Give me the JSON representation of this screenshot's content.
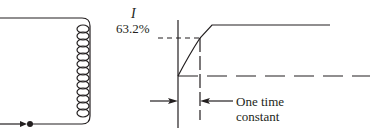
{
  "figure": {
    "circuit": {
      "components": [
        "wire",
        "inductor-coil",
        "junction-dot",
        "current-arrow"
      ]
    },
    "graph": {
      "y_label": "I",
      "level_label": "63.2%",
      "annotation_line1": "One time",
      "annotation_line2": "constant"
    },
    "colors": {
      "ink": "#231f20",
      "background": "#ffffff"
    }
  }
}
